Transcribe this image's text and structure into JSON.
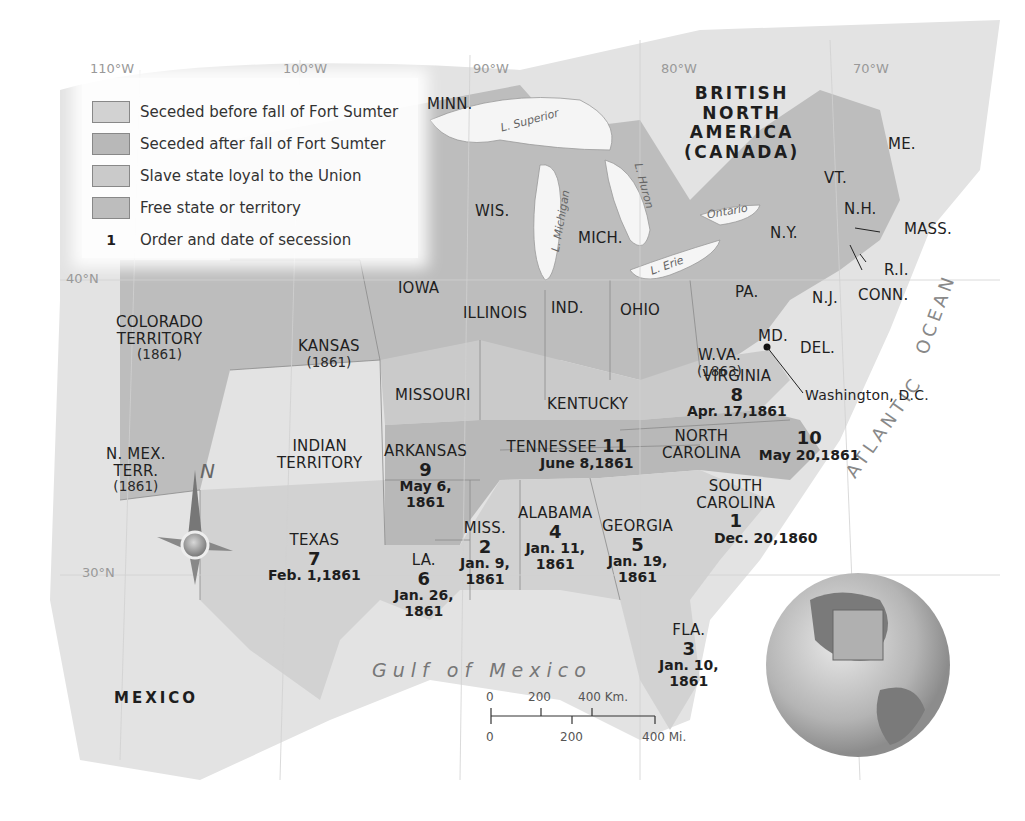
{
  "legend": {
    "items": [
      {
        "label": "Seceded before fall of Fort Sumter",
        "color": "#d2d2d2"
      },
      {
        "label": "Seceded after fall of Fort Sumter",
        "color": "#b8b8b8"
      },
      {
        "label": "Slave state loyal to the Union",
        "color": "#cacaca"
      },
      {
        "label": "Free state or territory",
        "color": "#bdbdbd"
      }
    ],
    "order_marker": "1",
    "order_label": "Order and date of secession"
  },
  "longitudes": [
    "110°W",
    "100°W",
    "90°W",
    "80°W",
    "70°W"
  ],
  "latitudes": [
    "40°N",
    "30°N"
  ],
  "regions": {
    "canada": [
      "BRITISH",
      "NORTH",
      "AMERICA",
      "(CANADA)"
    ],
    "mexico": "MEXICO",
    "gulf": "Gulf of Mexico",
    "ocean_atlantic": "ATLANTIC",
    "ocean_ocean": "OCEAN"
  },
  "lakes": {
    "superior": "L. Superior",
    "michigan": "L. Michigan",
    "huron": "L. Huron",
    "erie": "L. Erie",
    "ontario": "Ontario"
  },
  "free_states": {
    "minn": "MINN.",
    "wis": "WIS.",
    "mich": "MICH.",
    "iowa": "IOWA",
    "illinois": "ILLINOIS",
    "ind": "IND.",
    "ohio": "OHIO",
    "pa": "PA.",
    "ny": "N.Y.",
    "nj": "N.J.",
    "vt": "VT.",
    "nh": "N.H.",
    "me": "ME.",
    "mass": "MASS.",
    "ri": "R.I.",
    "conn": "CONN.",
    "kansas": "KANSAS",
    "kansas_year": "(1861)",
    "colorado": "COLORADO",
    "colorado_2": "TERRITORY",
    "colorado_year": "(1861)",
    "nmex": "N. MEX.",
    "nmex_2": "TERR.",
    "nmex_year": "(1861)",
    "wva": "W.VA.",
    "wva_year": "(1863)",
    "indian": "INDIAN",
    "indian_2": "TERRITORY"
  },
  "border_states": {
    "missouri": "MISSOURI",
    "kentucky": "KENTUCKY",
    "md": "MD.",
    "del": "DEL."
  },
  "capital": "Washington, D.C.",
  "seceded_states": [
    {
      "name": "SOUTH",
      "name2": "CAROLINA",
      "order": "1",
      "date": "Dec. 20,1860"
    },
    {
      "name": "MISS.",
      "order": "2",
      "date": "Jan. 9,",
      "date2": "1861"
    },
    {
      "name": "FLA.",
      "order": "3",
      "date": "Jan. 10,",
      "date2": "1861"
    },
    {
      "name": "ALABAMA",
      "order": "4",
      "date": "Jan. 11,",
      "date2": "1861"
    },
    {
      "name": "GEORGIA",
      "order": "5",
      "date": "Jan. 19,",
      "date2": "1861"
    },
    {
      "name": "LA.",
      "order": "6",
      "date": "Jan. 26,",
      "date2": "1861"
    },
    {
      "name": "TEXAS",
      "order": "7",
      "date": "Feb. 1,1861"
    },
    {
      "name": "VIRGINIA",
      "order": "8",
      "date": "Apr. 17,1861"
    },
    {
      "name": "ARKANSAS",
      "order": "9",
      "date": "May 6,",
      "date2": "1861"
    },
    {
      "name": "NORTH",
      "name2": "CAROLINA",
      "order": "10",
      "date": "May 20,1861"
    },
    {
      "name": "TENNESSEE",
      "order": "11",
      "date": "June 8,1861"
    }
  ],
  "compass": "N",
  "scale_bar": {
    "km_labels": [
      "0",
      "200",
      "400 Km."
    ],
    "mi_labels": [
      "0",
      "200",
      "400 Mi."
    ]
  }
}
